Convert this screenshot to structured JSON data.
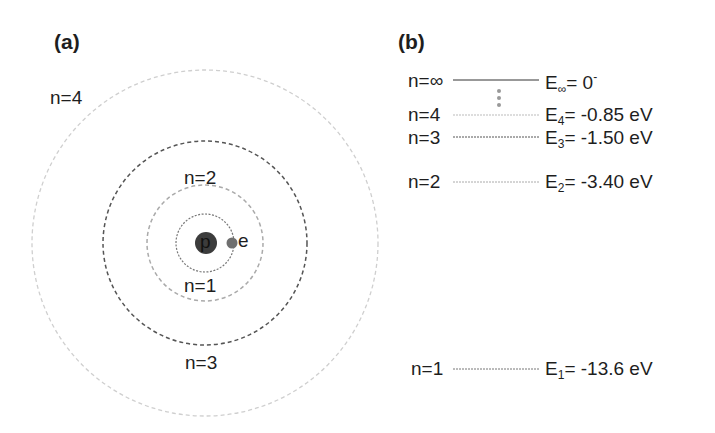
{
  "panel_a": {
    "label": "(a)",
    "nucleus_label": "p",
    "electron_label": "e",
    "orbits": [
      {
        "n": 1,
        "label": "n=1",
        "radius": 29,
        "color": "#777777"
      },
      {
        "n": 2,
        "label": "n=2",
        "radius": 58,
        "color": "#aaaaaa"
      },
      {
        "n": 3,
        "label": "n=3",
        "radius": 102,
        "color": "#555555"
      },
      {
        "n": 4,
        "label": "n=4",
        "radius": 173,
        "color": "#cccccc"
      }
    ]
  },
  "panel_b": {
    "label": "(b)",
    "levels": [
      {
        "n_label": "n=∞",
        "e_sym": "E",
        "e_sub": "∞",
        "e_value": "= 0",
        "e_sup": "-"
      },
      {
        "n_label": "n=4",
        "e_sym": "E",
        "e_sub": "4",
        "e_value": "= -0.85 eV"
      },
      {
        "n_label": "n=3",
        "e_sym": "E",
        "e_sub": "3",
        "e_value": "= -1.50 eV"
      },
      {
        "n_label": "n=2",
        "e_sym": "E",
        "e_sub": "2",
        "e_value": "= -3.40 eV"
      },
      {
        "n_label": "n=1",
        "e_sym": "E",
        "e_sub": "1",
        "e_value": "= -13.6 eV"
      }
    ]
  }
}
